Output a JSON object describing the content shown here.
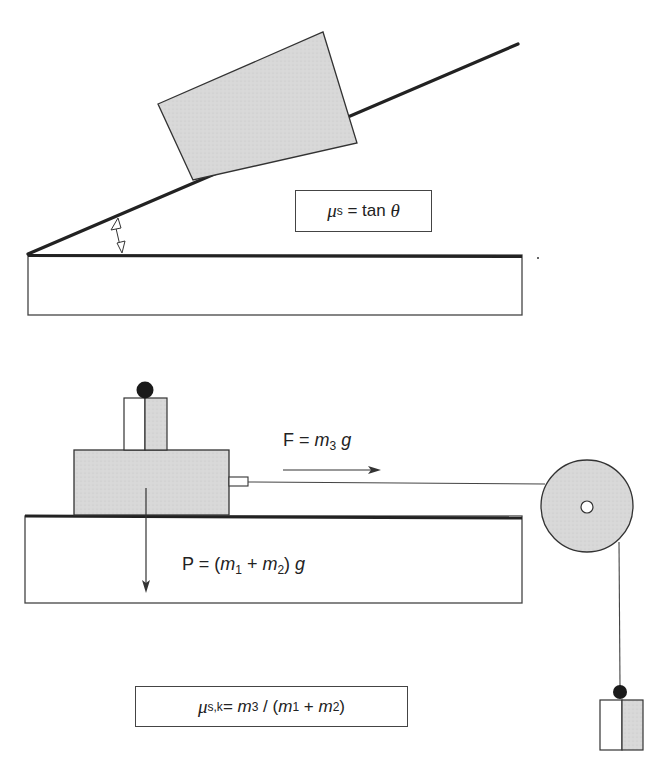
{
  "diagram": {
    "top_panel": {
      "title": "Inclined plane method",
      "formula": {
        "mu": "μ",
        "mu_sub": "s",
        "rest": " = tan ",
        "theta": "θ"
      },
      "angle_symbol": "θ"
    },
    "bottom_panel": {
      "title": "Horizontal pull with pulley method",
      "force_label": {
        "lhs": "F = ",
        "m": "m",
        "m_sub": "3",
        "g": " g"
      },
      "weight_label": {
        "lhs": "P = (",
        "m1": "m",
        "m1_sub": "1",
        "plus": " + ",
        "m2": "m",
        "m2_sub": "2",
        "rhs": ") ",
        "g": "g"
      },
      "formula": {
        "mu": "μ",
        "mu_sub": "s,k",
        "eq": "= ",
        "m3": "m",
        "m3_sub": "3",
        "div": " / (",
        "m1": "m",
        "m1_sub": "1",
        "plus": " + ",
        "m2": "m",
        "m2_sub": "2",
        "close": ")"
      }
    },
    "colors": {
      "fill_gray": "#d6d6d6",
      "stroke": "#333333",
      "ball": "#1a1a1a"
    }
  }
}
